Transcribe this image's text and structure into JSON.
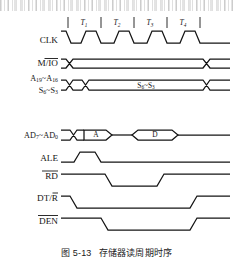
{
  "figure": {
    "caption_number": "图 5-13",
    "caption_title": "存储器读周期时序",
    "title_en": "Memory Read Cycle Timing"
  },
  "cycles": [
    {
      "label": "T",
      "sub": "1"
    },
    {
      "label": "T",
      "sub": "2"
    },
    {
      "label": "T",
      "sub": "3"
    },
    {
      "label": "T",
      "sub": "4"
    }
  ],
  "signals": [
    {
      "name": "CLK",
      "label": "CLK",
      "overbar": "none",
      "sub": "",
      "type": "clock"
    },
    {
      "name": "M/IO",
      "label": "M/",
      "label2": "IO",
      "overbar": "part",
      "type": "bus"
    },
    {
      "name": "A19-A16",
      "label": "A",
      "sub": "19",
      "label2": "~A",
      "sub2": "16",
      "type": "bus"
    },
    {
      "name": "S6-S3",
      "label": "S",
      "sub": "6",
      "label2": "~S",
      "sub2": "3",
      "type": "bus"
    },
    {
      "name": "AD7-AD0",
      "label": "AD",
      "sub": "7",
      "label2": "~AD",
      "sub2": "0",
      "type": "bus"
    },
    {
      "name": "ALE",
      "label": "ALE",
      "overbar": "none",
      "type": "pulse-high"
    },
    {
      "name": "RD",
      "label": "RD",
      "overbar": "full",
      "type": "pulse-low"
    },
    {
      "name": "DT/R",
      "label": "DT/",
      "label2": "R",
      "overbar": "part",
      "type": "pulse-low"
    },
    {
      "name": "DEN",
      "label": "DEN",
      "overbar": "full",
      "type": "pulse-low"
    }
  ],
  "bus_contents": {
    "status_label": "S",
    "status_sub": "6",
    "status_label2": "~S",
    "status_sub2": "3",
    "address_bubble": "A",
    "data_bubble": "D"
  },
  "colors": {
    "line": "#141414",
    "background": "#ffffff"
  }
}
